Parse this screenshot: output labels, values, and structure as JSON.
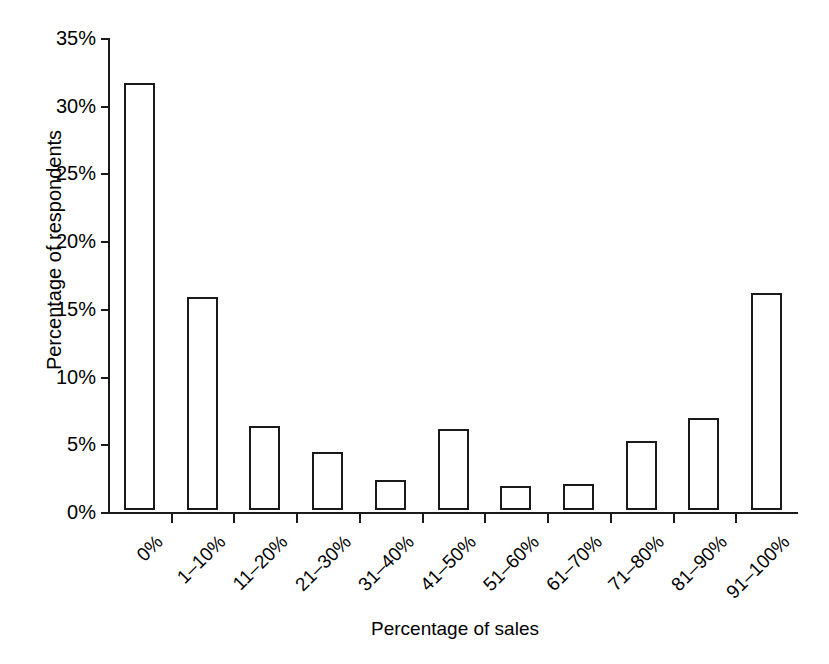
{
  "chart_data": {
    "type": "bar",
    "title": "",
    "xlabel": "Percentage of sales",
    "ylabel": "Percentage of respondents",
    "categories": [
      "0%",
      "1–10%",
      "11–20%",
      "21–30%",
      "31–40%",
      "41–50%",
      "51–60%",
      "61–70%",
      "71–80%",
      "81–90%",
      "91–100%"
    ],
    "values": [
      31.5,
      15.7,
      6.2,
      4.3,
      2.2,
      6.0,
      1.8,
      1.9,
      5.1,
      6.8,
      16.0
    ],
    "ylim": [
      0,
      35
    ],
    "ytick_values": [
      0,
      5,
      10,
      15,
      20,
      25,
      30,
      35
    ],
    "ytick_labels": [
      "0%",
      "5%",
      "10%",
      "15%",
      "20%",
      "25%",
      "30%",
      "35%"
    ],
    "grid": false,
    "legend": null,
    "bar_fill_color": "#ffffff",
    "bar_edge_color": "#1a1a1a",
    "axis_color": "#1a1a1a",
    "background_color": "#ffffff",
    "xtick_label_rotation": -45
  }
}
